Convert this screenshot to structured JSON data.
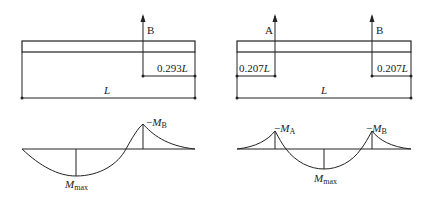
{
  "left_diagram": {
    "support_label": "B",
    "offset_value": "0.293",
    "offset_unit": "L",
    "span_label": "L",
    "moment_peak_sign": "−",
    "moment_peak_M": "M",
    "moment_peak_sub": "B",
    "moment_max_M": "M",
    "moment_max_sub": "max"
  },
  "right_diagram": {
    "support_a_label": "A",
    "support_b_label": "B",
    "offset_left_value": "0.207",
    "offset_left_unit": "L",
    "offset_right_value": "0.207",
    "offset_right_unit": "L",
    "span_label": "L",
    "moment_a_sign": "−",
    "moment_a_M": "M",
    "moment_a_sub": "A",
    "moment_b_sign": "−",
    "moment_b_M": "M",
    "moment_b_sub": "B",
    "moment_max_M": "M",
    "moment_max_sub": "max"
  }
}
